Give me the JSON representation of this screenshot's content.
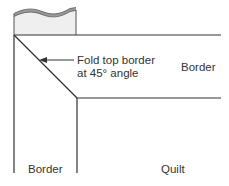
{
  "diagram": {
    "callout": {
      "line1": "Fold top border",
      "line2": "at 45° angle"
    },
    "labels": {
      "right_border": "Border",
      "left_border": "Border",
      "quilt": "Quilt"
    },
    "colors": {
      "line": "#333333",
      "fabric_fill": "#efefef",
      "fabric_edge": "#9a9a9a"
    }
  }
}
